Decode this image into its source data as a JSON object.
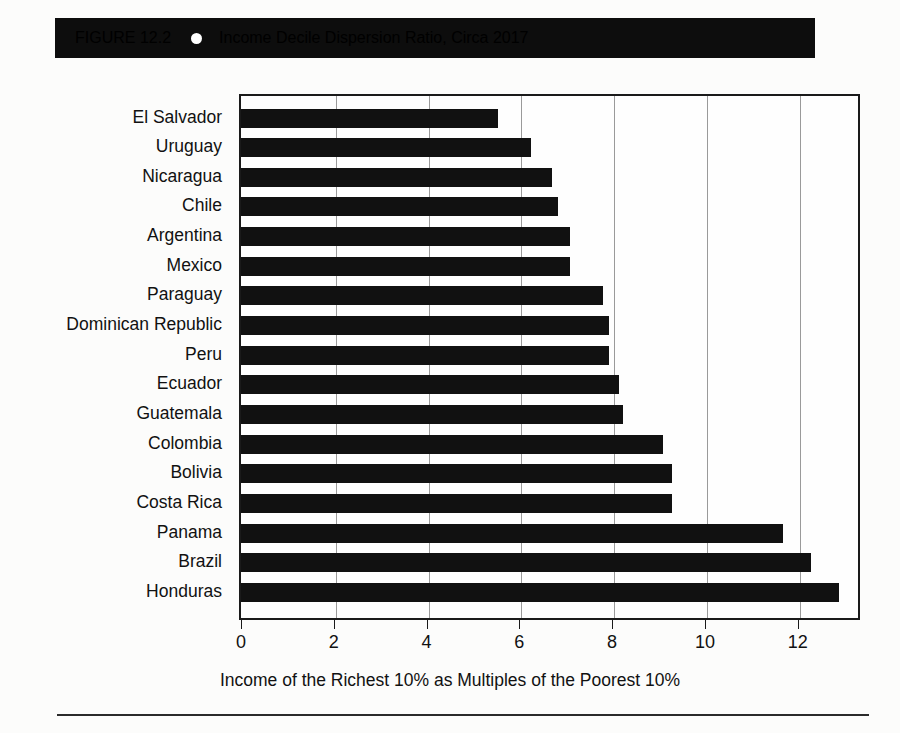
{
  "figure": {
    "number_label": "FIGURE 12.2",
    "bullet_icon": "bullet-dot-icon",
    "title": "Income Decile Dispersion Ratio, Circa 2017"
  },
  "chart_data": {
    "type": "bar",
    "orientation": "horizontal",
    "title": "Income Decile Dispersion Ratio, Circa 2017",
    "xlabel": "Income of the Richest 10% as Multiples of the Poorest 10%",
    "ylabel": "",
    "xlim": [
      0,
      13.3
    ],
    "xticks": [
      0,
      2,
      4,
      6,
      8,
      10,
      12
    ],
    "xtick_labels": [
      "0",
      "2",
      "4",
      "6",
      "8",
      "10",
      "12"
    ],
    "grid": "vertical",
    "legend": "none",
    "bar_color": "#111111",
    "categories": [
      "El Salvador",
      "Uruguay",
      "Nicaragua",
      "Chile",
      "Argentina",
      "Mexico",
      "Paraguay",
      "Dominican Republic",
      "Peru",
      "Ecuador",
      "Guatemala",
      "Colombia",
      "Bolivia",
      "Costa Rica",
      "Panama",
      "Brazil",
      "Honduras"
    ],
    "values": [
      5.5,
      6.2,
      6.65,
      6.8,
      7.05,
      7.05,
      7.75,
      7.9,
      7.9,
      8.1,
      8.2,
      9.05,
      9.25,
      9.25,
      11.65,
      12.25,
      12.85
    ]
  },
  "axis": {
    "x_title": "Income of the Richest 10% as Multiples of the Poorest 10%"
  }
}
